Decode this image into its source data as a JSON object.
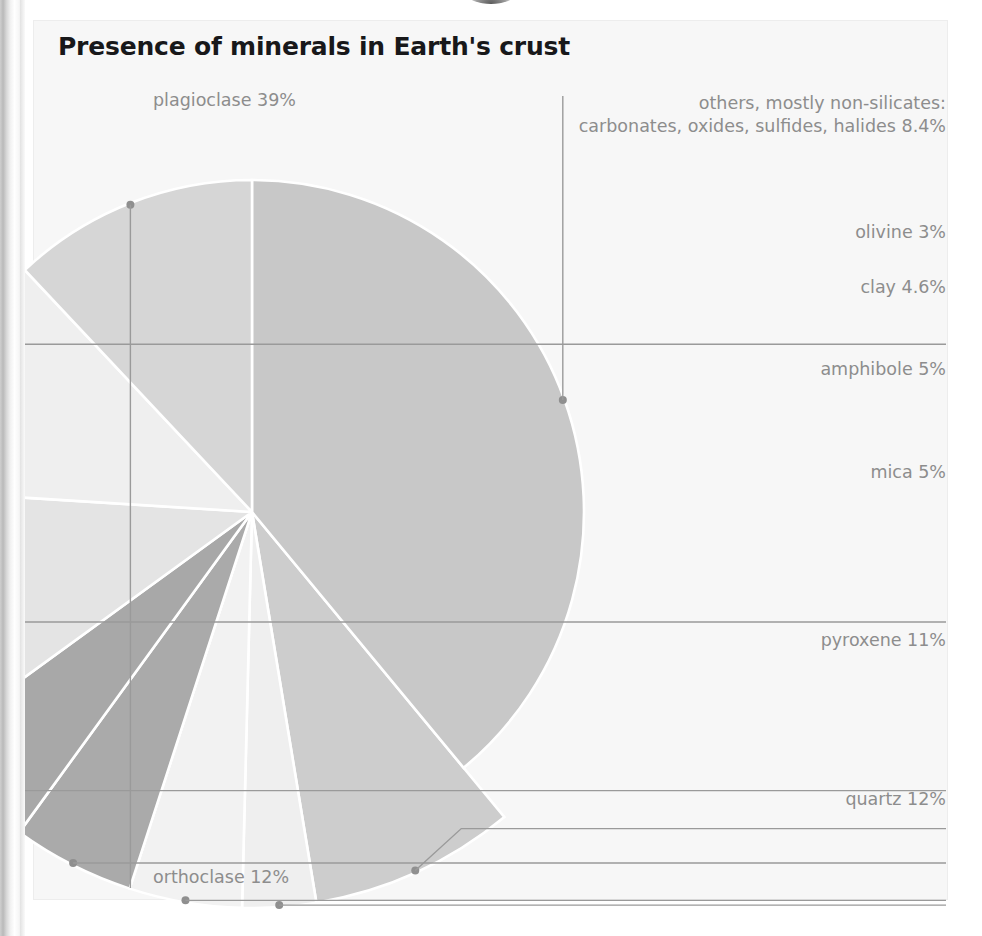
{
  "figure": {
    "title": "Presence of minerals in Earth's crust",
    "panel_background": "#f7f7f7",
    "label_color": "#8d8d8d",
    "title_color": "#18181a",
    "leader_color": "#9a9a9a"
  },
  "labels": {
    "plagioclase": "plagioclase 39%",
    "others_line1": "others, mostly non-silicates:",
    "others_line2": "carbonates, oxides, sulfides, halides 8.4%",
    "olivine": "olivine 3%",
    "clay": "clay 4.6%",
    "amphibole": "amphibole 5%",
    "mica": "mica 5%",
    "pyroxene": "pyroxene 11%",
    "quartz": "quartz 12%",
    "orthoclase": "orthoclase 12%"
  },
  "chart_data": {
    "type": "pie",
    "title": "Presence of minerals in Earth's crust",
    "xlabel": "",
    "ylabel": "",
    "legend_position": "callout-labels",
    "grid": false,
    "units": "percent of Earth's crust by volume",
    "total": 99.0,
    "categories": [
      "plagioclase",
      "others, mostly non-silicates: carbonates, oxides, sulfides, halides",
      "olivine",
      "clay",
      "amphibole",
      "mica",
      "pyroxene",
      "quartz",
      "orthoclase"
    ],
    "values": [
      39,
      8.4,
      3,
      4.6,
      5,
      5,
      11,
      12,
      12
    ],
    "slices": [
      {
        "name": "plagioclase",
        "value": 39,
        "label": "plagioclase 39%",
        "color": "#c8c8c8",
        "ring": false
      },
      {
        "name": "others",
        "value": 8.4,
        "label": "others, mostly non-silicates: carbonates, oxides, sulfides, halides 8.4%",
        "color": "#cdcdcd",
        "ring": true
      },
      {
        "name": "olivine",
        "value": 3,
        "label": "olivine 3%",
        "color": "#efefef",
        "ring": true
      },
      {
        "name": "clay",
        "value": 4.6,
        "label": "clay 4.6%",
        "color": "#f2f2f2",
        "ring": true
      },
      {
        "name": "amphibole",
        "value": 5,
        "label": "amphibole 5%",
        "color": "#aaaaaa",
        "ring": true
      },
      {
        "name": "mica",
        "value": 5,
        "label": "mica 5%",
        "color": "#a8a8a8",
        "ring": true
      },
      {
        "name": "pyroxene",
        "value": 11,
        "label": "pyroxene 11%",
        "color": "#e4e4e4",
        "ring": true
      },
      {
        "name": "quartz",
        "value": 12,
        "label": "quartz 12%",
        "color": "#efefef",
        "ring": true
      },
      {
        "name": "orthoclase",
        "value": 12,
        "label": "orthoclase 12%",
        "color": "#d6d6d6",
        "ring": false
      }
    ]
  }
}
